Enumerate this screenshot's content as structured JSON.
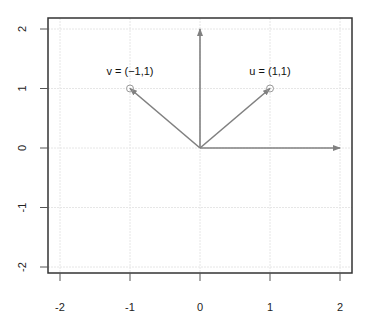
{
  "chart_data": {
    "type": "scatter",
    "title": "",
    "xlabel": "",
    "ylabel": "",
    "xlim": [
      -2.2,
      2.2
    ],
    "ylim": [
      -2.2,
      2.2
    ],
    "grid": true,
    "x_ticks": [
      -2,
      -1,
      0,
      1,
      2
    ],
    "y_ticks": [
      -2,
      -1,
      0,
      1,
      2
    ],
    "x_tick_labels": [
      "-2",
      "-1",
      "0",
      "1",
      "2"
    ],
    "y_tick_labels": [
      "-2",
      "-1",
      "0",
      "1",
      "2"
    ],
    "points": [
      {
        "name": "v",
        "x": -1,
        "y": 1,
        "label": "v = (−1,1)"
      },
      {
        "name": "u",
        "x": 1,
        "y": 1,
        "label": "u = (1,1)"
      }
    ],
    "arrows": [
      {
        "name": "v-vector",
        "from": [
          0,
          0
        ],
        "to": [
          -1,
          1
        ]
      },
      {
        "name": "u-vector",
        "from": [
          0,
          0
        ],
        "to": [
          1,
          1
        ]
      },
      {
        "name": "y-axis-vector",
        "from": [
          0,
          0
        ],
        "to": [
          0,
          2
        ]
      },
      {
        "name": "x-axis-vector",
        "from": [
          0,
          0
        ],
        "to": [
          2,
          0
        ]
      }
    ],
    "colors": {
      "arrow": "#808080",
      "grid": "#e6e6e6",
      "frame": "#333333",
      "point": "#999999"
    }
  }
}
